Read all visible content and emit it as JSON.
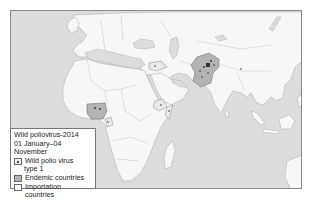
{
  "map": {
    "title": "Wild poliovirus-2014",
    "date_range": "01 January–04 November",
    "colors": {
      "ocean": "#dcdcdc",
      "land": "#f7f7f7",
      "border": "#b5b5b5",
      "endemic": "#b3b3b3",
      "importation": "#ffffff",
      "case_dot": "#333333"
    },
    "legend": {
      "items": [
        {
          "icon": "dot-square-icon",
          "label": "Wild polio virus",
          "label_cont": "type 1"
        },
        {
          "icon": "grey-square-icon",
          "label": "Endemic countries"
        },
        {
          "icon": "white-square-icon",
          "label": "Importation countries"
        }
      ]
    },
    "highlighted_regions": [
      {
        "name": "Pakistan/Afghanistan",
        "status": "endemic"
      },
      {
        "name": "Nigeria",
        "status": "endemic"
      },
      {
        "name": "Equatorial Guinea / Cameroon",
        "status": "importation"
      },
      {
        "name": "Ethiopia",
        "status": "importation"
      },
      {
        "name": "Somalia",
        "status": "importation"
      },
      {
        "name": "Syria / Iraq",
        "status": "importation"
      }
    ]
  }
}
